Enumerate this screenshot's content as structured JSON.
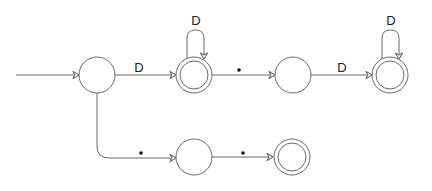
{
  "diagram": {
    "type": "finite-state-automaton",
    "colors": {
      "stroke": "#6a6a6a",
      "label": "#222222",
      "background": "#ffffff"
    },
    "states": [
      {
        "id": "q0",
        "start": true,
        "accept": false,
        "x": 97,
        "y": 75
      },
      {
        "id": "q1",
        "start": false,
        "accept": true,
        "x": 194,
        "y": 75
      },
      {
        "id": "q2",
        "start": false,
        "accept": false,
        "x": 293,
        "y": 75
      },
      {
        "id": "q3",
        "start": false,
        "accept": true,
        "x": 390,
        "y": 75
      },
      {
        "id": "q4",
        "start": false,
        "accept": false,
        "x": 194,
        "y": 157
      },
      {
        "id": "q5",
        "start": false,
        "accept": true,
        "x": 292,
        "y": 157
      }
    ],
    "transitions": [
      {
        "from": "q0",
        "to": "q1",
        "label": "D"
      },
      {
        "from": "q1",
        "to": "q1",
        "label": "D"
      },
      {
        "from": "q1",
        "to": "q2",
        "label": "•"
      },
      {
        "from": "q2",
        "to": "q3",
        "label": "D"
      },
      {
        "from": "q3",
        "to": "q3",
        "label": "D"
      },
      {
        "from": "q0",
        "to": "q4",
        "label": "•"
      },
      {
        "from": "q4",
        "to": "q5",
        "label": "•"
      }
    ],
    "labels": {
      "q0_q1": "D",
      "q1_loop": "D",
      "q2_q3": "D",
      "q3_loop": "D"
    }
  }
}
